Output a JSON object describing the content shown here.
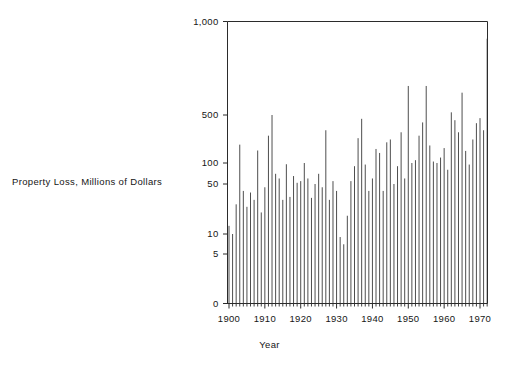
{
  "figure": {
    "title": "",
    "y_axis_label": "Property Loss, Millions of Dollars",
    "x_axis_label": "Year"
  },
  "chart_data": {
    "type": "bar",
    "title": "",
    "subtitle": "",
    "xlabel": "Year",
    "ylabel": "Property Loss, Millions of Dollars",
    "yscale": "log-segmented",
    "ylim": [
      0,
      1000
    ],
    "xlim": [
      1899,
      1973
    ],
    "grid": false,
    "legend": null,
    "annotations": [],
    "y_ticks": [
      0,
      5,
      10,
      50,
      100,
      500,
      1000
    ],
    "y_tick_labels": [
      "0",
      "5",
      "10",
      "50",
      "100",
      "500",
      "1,000"
    ],
    "x_ticks": [
      1900,
      1910,
      1920,
      1930,
      1940,
      1950,
      1960,
      1970
    ],
    "x_tick_labels": [
      "1900",
      "1910",
      "1920",
      "1930",
      "1940",
      "1950",
      "1960",
      "1970"
    ],
    "x_minor_tick_interval": 1,
    "categories": [
      1900,
      1901,
      1902,
      1903,
      1904,
      1905,
      1906,
      1907,
      1908,
      1909,
      1910,
      1911,
      1912,
      1913,
      1914,
      1915,
      1916,
      1917,
      1918,
      1919,
      1920,
      1921,
      1922,
      1923,
      1924,
      1925,
      1926,
      1927,
      1928,
      1929,
      1930,
      1931,
      1932,
      1933,
      1934,
      1935,
      1936,
      1937,
      1938,
      1939,
      1940,
      1941,
      1942,
      1943,
      1944,
      1945,
      1946,
      1947,
      1948,
      1949,
      1950,
      1951,
      1952,
      1953,
      1954,
      1955,
      1956,
      1957,
      1958,
      1959,
      1960,
      1961,
      1962,
      1963,
      1964,
      1965,
      1966,
      1967,
      1968,
      1969,
      1970,
      1971,
      1972
    ],
    "values": [
      13,
      10,
      26,
      185,
      40,
      24,
      38,
      30,
      152,
      20,
      45,
      250,
      500,
      70,
      60,
      30,
      96,
      33,
      65,
      52,
      55,
      100,
      60,
      32,
      50,
      70,
      45,
      300,
      30,
      55,
      40,
      9,
      7,
      18,
      55,
      90,
      230,
      440,
      95,
      40,
      60,
      160,
      140,
      40,
      200,
      220,
      50,
      90,
      280,
      60,
      620,
      100,
      110,
      250,
      390,
      620,
      180,
      105,
      100,
      120,
      165,
      80,
      510,
      420,
      280,
      590,
      150,
      95,
      220,
      380,
      450,
      300,
      880
    ],
    "series": [
      {
        "name": "Property Loss",
        "values": [
          13,
          10,
          26,
          185,
          40,
          24,
          38,
          30,
          152,
          20,
          45,
          250,
          500,
          70,
          60,
          30,
          96,
          33,
          65,
          52,
          55,
          100,
          60,
          32,
          50,
          70,
          45,
          300,
          30,
          55,
          40,
          9,
          7,
          18,
          55,
          90,
          230,
          440,
          95,
          40,
          60,
          160,
          140,
          40,
          200,
          220,
          50,
          90,
          280,
          60,
          620,
          100,
          110,
          250,
          390,
          620,
          180,
          105,
          100,
          120,
          165,
          80,
          510,
          420,
          280,
          590,
          150,
          95,
          220,
          380,
          450,
          300,
          880
        ]
      }
    ]
  }
}
